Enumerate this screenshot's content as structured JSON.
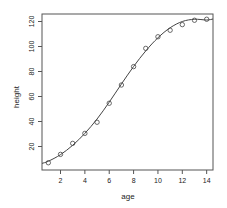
{
  "chart_data": {
    "type": "scatter",
    "title": "",
    "xlabel": "age",
    "ylabel": "height",
    "xlim": [
      0.48,
      14.52
    ],
    "ylim": [
      1.2,
      126.0
    ],
    "x_ticks": [
      2,
      4,
      6,
      8,
      10,
      12,
      14
    ],
    "y_ticks": [
      20,
      40,
      60,
      80,
      100,
      120
    ],
    "grid": false,
    "legend": null,
    "series": [
      {
        "name": "observed",
        "kind": "points",
        "marker": "open-circle",
        "x": [
          1,
          2,
          3,
          4,
          5,
          6,
          7,
          8,
          9,
          10,
          11,
          12,
          13,
          14
        ],
        "y": [
          7,
          13.7,
          22.5,
          30.5,
          39.4,
          54.6,
          69.2,
          83.9,
          98.5,
          107.8,
          113,
          117.5,
          121,
          121.8
        ]
      },
      {
        "name": "fitted",
        "kind": "line",
        "x": [
          0.48,
          1,
          2,
          3,
          4,
          5,
          6,
          7,
          8,
          9,
          10,
          11,
          12,
          13,
          14,
          14.52
        ],
        "y": [
          6.5,
          8.2,
          13.5,
          21.0,
          30.5,
          42.0,
          55.5,
          70.0,
          84.0,
          96.5,
          107.0,
          115.0,
          120.0,
          121.8,
          121.2,
          122.0
        ]
      }
    ]
  },
  "colors": {
    "background": "#ffffff",
    "axis": "#555555",
    "line": "#444444",
    "points": "#444444"
  }
}
